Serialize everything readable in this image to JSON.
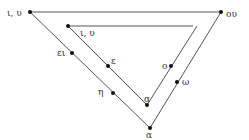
{
  "diagram": {
    "type": "vowel-triangle",
    "outer_triangle": {
      "vertices": {
        "top_left": {
          "x": 30,
          "y": 12,
          "label": "ι, υ"
        },
        "top_right": {
          "x": 221,
          "y": 12,
          "label": "ου"
        },
        "bottom": {
          "x": 150,
          "y": 128,
          "label": "α"
        }
      },
      "side_points": [
        {
          "x": 72,
          "y": 53,
          "label": "ει"
        },
        {
          "x": 113,
          "y": 93,
          "label": "η"
        },
        {
          "x": 177,
          "y": 82,
          "label": "ω"
        }
      ]
    },
    "inner_triangle": {
      "vertices": {
        "top_left": {
          "x": 68,
          "y": 26,
          "label": "ι, υ"
        },
        "top_right": {
          "x": 197,
          "y": 26,
          "label": ""
        },
        "bottom": {
          "x": 147,
          "y": 105,
          "label": "α"
        }
      },
      "side_points": [
        {
          "x": 108,
          "y": 66,
          "label": "ε"
        },
        {
          "x": 171,
          "y": 66,
          "label": "ο"
        }
      ]
    }
  }
}
